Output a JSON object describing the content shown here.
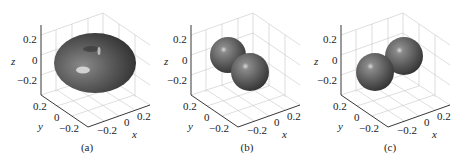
{
  "figure": {
    "panels": [
      {
        "id": "a",
        "caption": "(a)",
        "offset_x": 0,
        "shape": "torus",
        "ticks": {
          "z": [
            "0.2",
            "0",
            "−0.2"
          ],
          "y": [
            "0.2",
            "0",
            "−0.2"
          ],
          "x": [
            "−0.2",
            "0",
            "0.2"
          ]
        },
        "axis_labels": {
          "x": "x",
          "y": "y",
          "z": "z"
        }
      },
      {
        "id": "b",
        "caption": "(b)",
        "offset_x": 150,
        "shape": "two-spheres",
        "ticks": {
          "z": [
            "0.2",
            "0",
            "−0.2"
          ],
          "y": [
            "0.2",
            "0",
            "−0.2"
          ],
          "x": [
            "−0.2",
            "0",
            "0.2"
          ]
        },
        "axis_labels": {
          "x": "x",
          "y": "y",
          "z": "z"
        }
      },
      {
        "id": "c",
        "caption": "(c)",
        "offset_x": 300,
        "shape": "two-spheres",
        "ticks": {
          "z": [
            "0.2",
            "0",
            "−0.2"
          ],
          "y": [
            "0.2",
            "0",
            "−0.2"
          ],
          "x": [
            "−0.2",
            "0",
            "0.2"
          ]
        },
        "axis_labels": {
          "x": "x",
          "y": "y",
          "z": "z"
        }
      }
    ],
    "colors": {
      "surface": "#5a5a5a",
      "surface_dark": "#2e2e2e",
      "highlight": "#d8d8d8",
      "grid": "#c8c8c8",
      "axis": "#222222"
    }
  }
}
